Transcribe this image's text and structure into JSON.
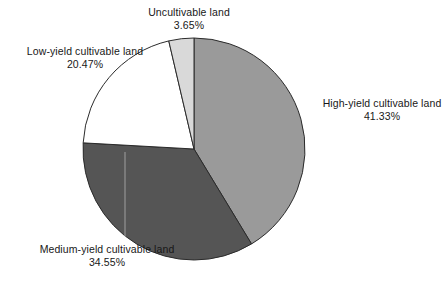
{
  "chart_data": {
    "type": "pie",
    "title": "",
    "subtitle": "",
    "xlabel": "",
    "ylabel": "",
    "legend_position": "labels-outside",
    "grid": false,
    "start_angle_deg": 0,
    "direction": "clockwise",
    "unit": "%",
    "categories": [
      "High-yield cultivable land",
      "Medium-yield cultivable land",
      "Low-yield cultivable land",
      "Uncultivable land"
    ],
    "values": [
      41.33,
      34.55,
      20.47,
      3.65
    ],
    "value_labels": [
      "41.33%",
      "34.55%",
      "20.47%",
      "3.65%"
    ],
    "colors": [
      "#9a9a9a",
      "#555555",
      "#ffffff",
      "#d9d9d9"
    ],
    "slices": [
      {
        "name": "High-yield cultivable land",
        "value": 41.33,
        "value_label": "41.33%",
        "color": "#9a9a9a",
        "start_deg": 0,
        "end_deg": 148.79
      },
      {
        "name": "Medium-yield cultivable land",
        "value": 34.55,
        "value_label": "34.55%",
        "color": "#555555",
        "start_deg": 148.79,
        "end_deg": 273.17
      },
      {
        "name": "Low-yield cultivable land",
        "value": 20.47,
        "value_label": "20.47%",
        "color": "#ffffff",
        "start_deg": 273.17,
        "end_deg": 346.86
      },
      {
        "name": "Uncultivable land",
        "value": 3.65,
        "value_label": "3.65%",
        "color": "#d9d9d9",
        "start_deg": 346.86,
        "end_deg": 360
      }
    ]
  },
  "labels": {
    "uncultivable": {
      "name": "Uncultivable land",
      "value": "3.65%"
    },
    "low_yield": {
      "name": "Low-yield cultivable land",
      "value": "20.47%"
    },
    "high_yield": {
      "name": "High-yield cultivable land",
      "value": "41.33%"
    },
    "medium_yield": {
      "name": "Medium-yield cultivable land",
      "value": "34.55%"
    }
  },
  "geometry": {
    "cx": 194,
    "cy": 149,
    "r": 111,
    "stroke": "#2b2b2b",
    "stroke_width": 1
  }
}
